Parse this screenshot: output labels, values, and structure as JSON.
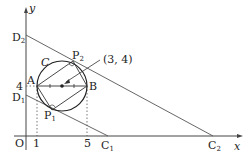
{
  "diagram": {
    "axes": {
      "x_label": "x",
      "y_label": "y",
      "origin_label": "O"
    },
    "ticks": {
      "x": [
        "1",
        "5"
      ],
      "y": [
        "4"
      ]
    },
    "circle": {
      "label": "C",
      "center_label": "(3, 4)"
    },
    "points": {
      "A": "A",
      "B": "B",
      "P1": "P",
      "P1_sub": "1",
      "P2": "P",
      "P2_sub": "2",
      "C1": "C",
      "C1_sub": "1",
      "C2": "C",
      "C2_sub": "2",
      "D1": "D",
      "D1_sub": "1",
      "D2": "D",
      "D2_sub": "2"
    }
  }
}
